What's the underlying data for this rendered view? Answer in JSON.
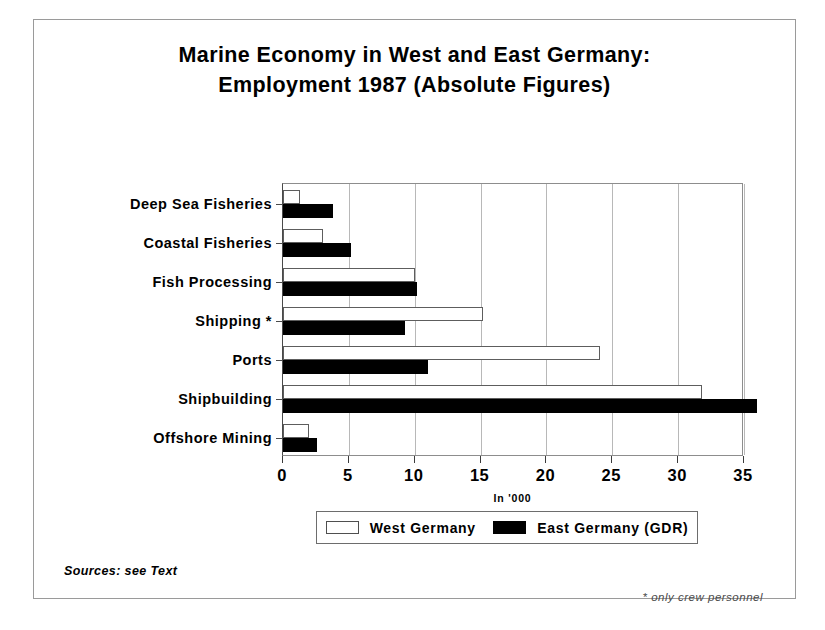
{
  "chart_data": {
    "type": "bar",
    "orientation": "horizontal",
    "title": "Marine Economy in West and East Germany: Employment 1987 (Absolute Figures)",
    "title_lines": [
      "Marine Economy in West and East Germany:",
      "Employment 1987 (Absolute Figures)"
    ],
    "xlabel": "In '000",
    "ylabel": "",
    "xlim": [
      0,
      35
    ],
    "xticks": [
      0,
      5,
      10,
      15,
      20,
      25,
      30,
      35
    ],
    "xtick_labels": [
      "0",
      "5",
      "10",
      "15",
      "20",
      "25",
      "30",
      "35"
    ],
    "grid": "vertical",
    "legend_position": "below-axis",
    "categories": [
      "Deep Sea Fisheries",
      "Coastal Fisheries",
      "Fish Processing",
      "Shipping *",
      "Ports",
      "Shipbuilding",
      "Offshore Mining"
    ],
    "series": [
      {
        "name": "West Germany",
        "color": "#ffffff",
        "edge_color": "#000000",
        "values": [
          1.3,
          3.0,
          10.0,
          15.2,
          24.1,
          31.8,
          2.0
        ]
      },
      {
        "name": "East Germany (GDR)",
        "color": "#000000",
        "edge_color": "#000000",
        "values": [
          3.8,
          5.2,
          10.2,
          9.3,
          11.0,
          36.0,
          2.6
        ]
      }
    ],
    "annotations": {
      "source_note": "Sources: see Text",
      "footnote": "* only crew personnel"
    }
  }
}
